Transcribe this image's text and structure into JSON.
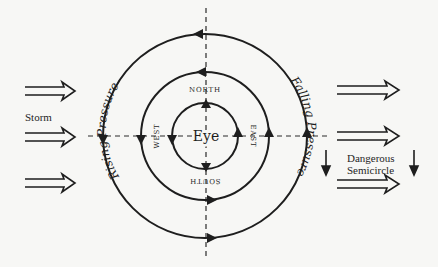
{
  "diagram": {
    "center_label": "Eye",
    "directions": {
      "north": "NORTH",
      "south": "SOUTH",
      "east": "EAST",
      "west": "WEST"
    },
    "arc_labels": {
      "left": "Rising Pressure",
      "right": "Falling Pressure"
    },
    "side_labels": {
      "storm": "Storm",
      "dangerous_line1": "Dangerous",
      "dangerous_line2": "Semicircle"
    },
    "circles": [
      {
        "name": "outer",
        "radius": 102
      },
      {
        "name": "middle",
        "radius": 64
      },
      {
        "name": "inner",
        "radius": 33
      }
    ],
    "rotation": "counterclockwise",
    "storm_motion_arrows": {
      "left_count": 3,
      "right_count": 3
    },
    "down_arrows_count": 2,
    "colors": {
      "ink": "#1e1e1e",
      "background": "#f7f7f5"
    }
  }
}
